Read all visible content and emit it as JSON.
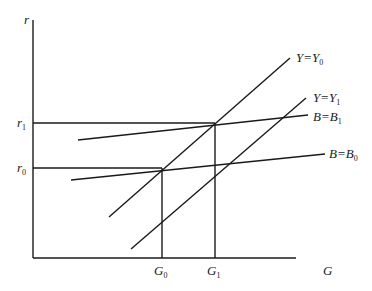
{
  "diagram": {
    "axes": {
      "y_label": "r",
      "x_label": "G"
    },
    "y_ticks": [
      {
        "base": "r",
        "sub": "1"
      },
      {
        "base": "r",
        "sub": "0"
      }
    ],
    "x_ticks": [
      {
        "base": "G",
        "sub": "0"
      },
      {
        "base": "G",
        "sub": "1"
      }
    ],
    "curves": [
      {
        "base1": "Y",
        "eq": "=",
        "base2": "Y",
        "sub": "0"
      },
      {
        "base1": "Y",
        "eq": "=",
        "base2": "Y",
        "sub": "1"
      },
      {
        "base1": "B",
        "eq": "=",
        "base2": "B",
        "sub": "1"
      },
      {
        "base1": "B",
        "eq": "=",
        "base2": "B",
        "sub": "0"
      }
    ]
  }
}
